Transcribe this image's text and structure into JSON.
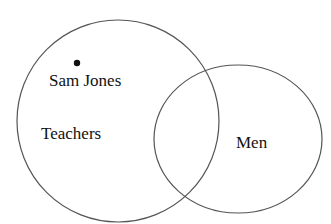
{
  "diagram": {
    "type": "venn",
    "sets": [
      {
        "name": "Teachers",
        "label": "Teachers"
      },
      {
        "name": "Men",
        "label": "Men"
      }
    ],
    "element": {
      "label": "Sam Jones",
      "member_of": [
        "Teachers"
      ]
    },
    "stroke_color": "#555555"
  }
}
